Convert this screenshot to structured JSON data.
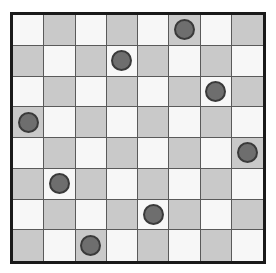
{
  "board": {
    "name": "checkerboard",
    "rows": 8,
    "columns": 8,
    "light_cell_color": "#f7f7f7",
    "dark_cell_color": "#c9c9c9",
    "grid_line_color": "#5a5a5a",
    "border_color": "#1a1a1a",
    "piece_fill_color": "#6e6e6e",
    "piece_outline_color": "#3a3a3a",
    "piece_count": 8,
    "cells": [
      [
        "light",
        "dark",
        "light",
        "dark",
        "light",
        "dark",
        "light",
        "dark"
      ],
      [
        "dark",
        "light",
        "dark",
        "light",
        "dark",
        "light",
        "dark",
        "light"
      ],
      [
        "light",
        "dark",
        "light",
        "dark",
        "light",
        "dark",
        "light",
        "dark"
      ],
      [
        "dark",
        "light",
        "dark",
        "light",
        "dark",
        "light",
        "dark",
        "light"
      ],
      [
        "light",
        "dark",
        "light",
        "dark",
        "light",
        "dark",
        "light",
        "dark"
      ],
      [
        "dark",
        "light",
        "dark",
        "light",
        "dark",
        "light",
        "dark",
        "light"
      ],
      [
        "light",
        "dark",
        "light",
        "dark",
        "light",
        "dark",
        "light",
        "dark"
      ],
      [
        "dark",
        "light",
        "dark",
        "light",
        "dark",
        "light",
        "dark",
        "light"
      ]
    ],
    "pieces": [
      {
        "row": 1,
        "col": 6,
        "cell": "dark"
      },
      {
        "row": 2,
        "col": 4,
        "cell": "light"
      },
      {
        "row": 3,
        "col": 7,
        "cell": "light"
      },
      {
        "row": 4,
        "col": 1,
        "cell": "dark"
      },
      {
        "row": 5,
        "col": 8,
        "cell": "dark"
      },
      {
        "row": 6,
        "col": 2,
        "cell": "light"
      },
      {
        "row": 7,
        "col": 5,
        "cell": "light"
      },
      {
        "row": 8,
        "col": 3,
        "cell": "dark"
      }
    ],
    "occupancy": [
      [
        0,
        0,
        0,
        0,
        0,
        1,
        0,
        0
      ],
      [
        0,
        0,
        0,
        1,
        0,
        0,
        0,
        0
      ],
      [
        0,
        0,
        0,
        0,
        0,
        0,
        1,
        0
      ],
      [
        1,
        0,
        0,
        0,
        0,
        0,
        0,
        0
      ],
      [
        0,
        0,
        0,
        0,
        0,
        0,
        0,
        1
      ],
      [
        0,
        1,
        0,
        0,
        0,
        0,
        0,
        0
      ],
      [
        0,
        0,
        0,
        0,
        1,
        0,
        0,
        0
      ],
      [
        0,
        0,
        1,
        0,
        0,
        0,
        0,
        0
      ]
    ]
  }
}
